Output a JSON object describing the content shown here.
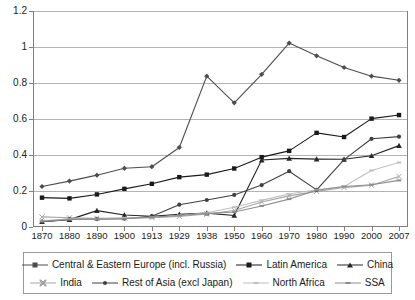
{
  "chart_data": {
    "type": "line",
    "title": "",
    "xlabel": "",
    "ylabel": "",
    "grid": true,
    "legend_position": "bottom",
    "ylim": [
      0,
      1.2
    ],
    "yticks": [
      "0",
      "0.2",
      "0.4",
      "0.6",
      "0.8",
      "1",
      "1.2"
    ],
    "ytick_values": [
      0,
      0.2,
      0.4,
      0.6,
      0.8,
      1,
      1.2
    ],
    "categories": [
      "1870",
      "1880",
      "1890",
      "1900",
      "1913",
      "1929",
      "1938",
      "1950",
      "1960",
      "1970",
      "1980",
      "1990",
      "2000",
      "2007"
    ],
    "series": [
      {
        "name": "Central & Eastern Europe (incl. Russia)",
        "marker": "diamond",
        "color": "#4d4d4d",
        "values": [
          0.225,
          0.255,
          0.288,
          0.326,
          0.335,
          0.442,
          0.838,
          0.69,
          0.848,
          1.022,
          0.951,
          0.886,
          0.838,
          0.815
        ]
      },
      {
        "name": "Latin America",
        "marker": "square",
        "color": "#1a1a1a",
        "values": [
          0.163,
          0.159,
          0.181,
          0.212,
          0.24,
          0.277,
          0.291,
          0.325,
          0.388,
          0.423,
          0.523,
          0.5,
          0.602,
          0.622
        ]
      },
      {
        "name": "China",
        "marker": "triangle",
        "color": "#262626",
        "values": [
          0.03,
          0.041,
          0.091,
          0.067,
          0.06,
          0.07,
          0.077,
          0.064,
          0.372,
          0.381,
          0.377,
          0.376,
          0.396,
          0.452
        ]
      },
      {
        "name": "India",
        "marker": "x",
        "color": "#a6a6a6",
        "values": [
          0.056,
          0.051,
          0.048,
          0.05,
          0.052,
          0.059,
          0.072,
          0.092,
          0.139,
          0.173,
          0.198,
          0.219,
          0.232,
          0.281
        ]
      },
      {
        "name": "Rest of Asia (excl Japan)",
        "marker": "dot",
        "color": "#404040",
        "values": [
          0.03,
          0.044,
          0.045,
          0.046,
          0.06,
          0.124,
          0.15,
          0.178,
          0.233,
          0.31,
          0.206,
          0.374,
          0.49,
          0.502
        ]
      },
      {
        "name": "North Africa",
        "marker": "dash",
        "color": "#c0c0c0",
        "values": [
          0.035,
          0.045,
          0.046,
          0.05,
          0.053,
          0.063,
          0.079,
          0.11,
          0.148,
          0.183,
          0.207,
          0.225,
          0.314,
          0.358
        ]
      },
      {
        "name": "SSA",
        "marker": "dash",
        "color": "#8c8c8c",
        "values": [
          0.031,
          0.042,
          0.044,
          0.046,
          0.055,
          0.064,
          0.075,
          0.083,
          0.117,
          0.155,
          0.204,
          0.225,
          0.235,
          0.259
        ]
      }
    ]
  },
  "legend": {
    "rows": [
      [
        {
          "label": "Central & Eastern Europe (incl. Russia)",
          "marker": "diamond",
          "color": "#4d4d4d"
        },
        {
          "label": "Latin America",
          "marker": "square",
          "color": "#1a1a1a"
        },
        {
          "label": "China",
          "marker": "triangle",
          "color": "#262626"
        }
      ],
      [
        {
          "label": "India",
          "marker": "x",
          "color": "#a6a6a6"
        },
        {
          "label": "Rest of Asia (excl Japan)",
          "marker": "dot",
          "color": "#404040"
        },
        {
          "label": "North Africa",
          "marker": "dash",
          "color": "#c0c0c0"
        },
        {
          "label": "SSA",
          "marker": "dash",
          "color": "#8c8c8c"
        }
      ]
    ]
  },
  "colors": {
    "gridline": "#b3b3b3",
    "axis": "#7f7f7f",
    "text": "#1a1a1a",
    "background": "#ffffff",
    "legend_border": "#9a9a9a"
  }
}
